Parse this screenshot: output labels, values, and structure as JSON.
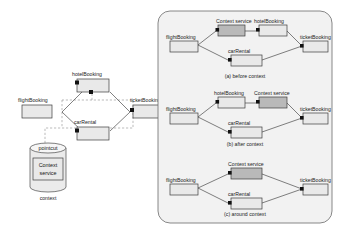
{
  "figure": {
    "left_diagram": {
      "name": "context-service-pointcut-diagram",
      "nodes": {
        "flight": "flightBooking",
        "hotel": "hotelBooking",
        "car": "carRental",
        "ticket": "ticketBooking"
      },
      "pointcut_label": "pointcut",
      "context_service_line1": "Context",
      "context_service_line2": "service",
      "context_caption": "context"
    },
    "right_panel": {
      "name": "weaving-variants-panel",
      "variants": [
        {
          "id": "a",
          "caption": "(a)  before  context",
          "nodes": {
            "flight": "flightBooking",
            "context": "Context service",
            "hotel": "hotelBooking",
            "car": "carRental",
            "ticket": "ticketBooking"
          }
        },
        {
          "id": "b",
          "caption": "(b)  after  context",
          "nodes": {
            "flight": "flightBooking",
            "hotel": "hotelBooking",
            "context": "Context service",
            "car": "carRental",
            "ticket": "ticketBooking"
          }
        },
        {
          "id": "c",
          "caption": "(c)  around  context",
          "nodes": {
            "flight": "flightBooking",
            "context": "Context service",
            "car": "carRental",
            "ticket": "ticketBooking"
          }
        }
      ]
    },
    "colors": {
      "box_fill": "#e9e9e9",
      "shaded_fill": "#b9b9b9",
      "stroke": "#3c3c3c",
      "panel_fill": "#f2f2f2",
      "panel_stroke": "#6b6b6b",
      "background": "#ffffff"
    }
  }
}
